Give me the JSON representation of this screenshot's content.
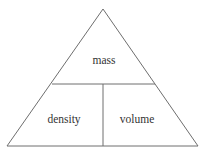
{
  "diagram": {
    "type": "formula-triangle",
    "top_label": "mass",
    "bottom_left_label": "density",
    "bottom_right_label": "volume",
    "line_color": "#6e6e6e",
    "text_color": "#333333"
  }
}
